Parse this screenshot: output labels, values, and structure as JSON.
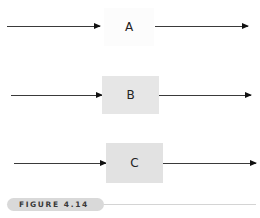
{
  "figure": {
    "caption": "FIGURE 4.14"
  },
  "rows": [
    {
      "label": "A",
      "box_fill": "#fcfcfc",
      "description": "process block with no visible shading"
    },
    {
      "label": "B",
      "box_fill": "#e6e6e6",
      "description": "process block with light gray shading"
    },
    {
      "label": "C",
      "box_fill": "#e2e2e2",
      "description": "process block with light gray shading"
    }
  ],
  "colors": {
    "arrow": "#3a3a3a",
    "arrowhead": "#111111",
    "caption_pill": "#d9d9d9",
    "caption_text": "#3a3a3a",
    "caption_rule": "#d4d4d4"
  }
}
